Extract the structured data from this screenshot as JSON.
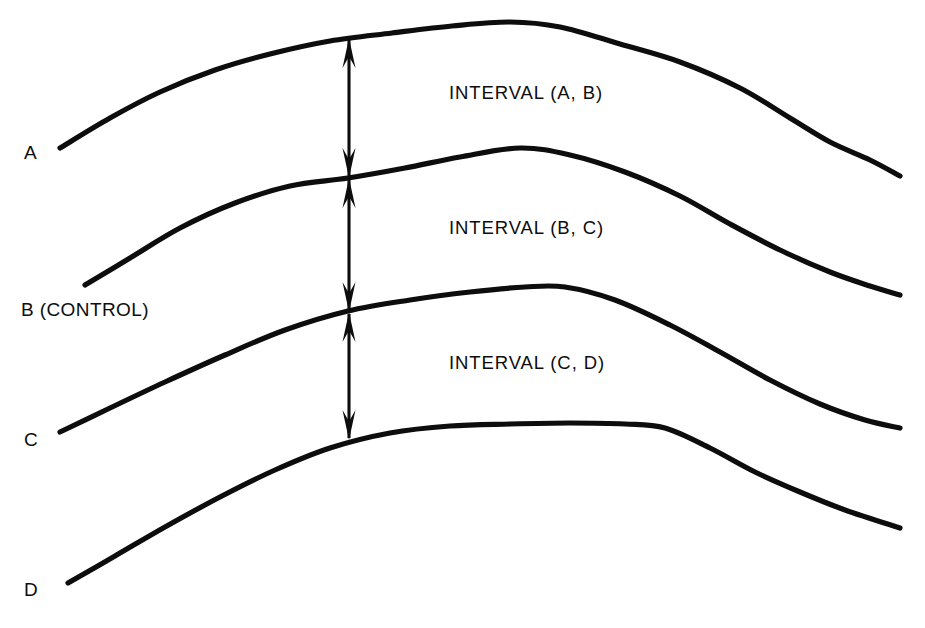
{
  "figure": {
    "type": "line-diagram",
    "background_color": "#ffffff",
    "stroke_color": "#0d0d0d",
    "width": 925,
    "height": 628
  },
  "curve_labels": [
    {
      "id": "A",
      "text": "A",
      "x": 24,
      "y": 143
    },
    {
      "id": "B",
      "text": "B (CONTROL)",
      "x": 21,
      "y": 300
    },
    {
      "id": "C",
      "text": "C",
      "x": 24,
      "y": 430
    },
    {
      "id": "D",
      "text": "D",
      "x": 24,
      "y": 580
    }
  ],
  "interval_labels": [
    {
      "id": "AB",
      "text": "INTERVAL (A, B)",
      "x": 449,
      "y": 84
    },
    {
      "id": "BC",
      "text": "INTERVAL (B, C)",
      "x": 449,
      "y": 219
    },
    {
      "id": "CD",
      "text": "INTERVAL (C, D)",
      "x": 449,
      "y": 354
    }
  ],
  "chart_data": {
    "type": "line",
    "title": "",
    "xlabel": "",
    "ylabel": "",
    "grid": false,
    "legend": "inline-left",
    "axis_visible": false,
    "note": "Four parallel response curves rising to a plateau then declining; vertical double-headed arrows mark the constant vertical separation (interval) between adjacent curves at x=349.",
    "series": [
      {
        "name": "A",
        "label": "A",
        "points": [
          [
            60,
            148
          ],
          [
            110,
            118
          ],
          [
            160,
            92
          ],
          [
            215,
            70
          ],
          [
            270,
            54
          ],
          [
            330,
            41
          ],
          [
            392,
            33
          ],
          [
            452,
            26
          ],
          [
            510,
            22
          ],
          [
            560,
            27
          ],
          [
            620,
            44
          ],
          [
            680,
            62
          ],
          [
            740,
            88
          ],
          [
            790,
            118
          ],
          [
            830,
            142
          ],
          [
            870,
            160
          ],
          [
            900,
            176
          ]
        ]
      },
      {
        "name": "B",
        "label": "B (CONTROL)",
        "points": [
          [
            85,
            285
          ],
          [
            130,
            258
          ],
          [
            180,
            228
          ],
          [
            235,
            203
          ],
          [
            290,
            186
          ],
          [
            348,
            178
          ],
          [
            405,
            168
          ],
          [
            460,
            157
          ],
          [
            520,
            148
          ],
          [
            570,
            155
          ],
          [
            625,
            172
          ],
          [
            680,
            196
          ],
          [
            730,
            224
          ],
          [
            780,
            250
          ],
          [
            830,
            272
          ],
          [
            870,
            286
          ],
          [
            900,
            295
          ]
        ]
      },
      {
        "name": "C",
        "label": "C",
        "points": [
          [
            60,
            432
          ],
          [
            110,
            408
          ],
          [
            165,
            382
          ],
          [
            225,
            355
          ],
          [
            285,
            330
          ],
          [
            348,
            311
          ],
          [
            410,
            300
          ],
          [
            470,
            292
          ],
          [
            525,
            287
          ],
          [
            565,
            287
          ],
          [
            615,
            300
          ],
          [
            670,
            325
          ],
          [
            720,
            352
          ],
          [
            770,
            380
          ],
          [
            820,
            404
          ],
          [
            865,
            420
          ],
          [
            900,
            428
          ]
        ]
      },
      {
        "name": "D",
        "label": "D",
        "points": [
          [
            68,
            583
          ],
          [
            115,
            556
          ],
          [
            165,
            527
          ],
          [
            220,
            497
          ],
          [
            275,
            470
          ],
          [
            330,
            448
          ],
          [
            390,
            433
          ],
          [
            450,
            426
          ],
          [
            510,
            424
          ],
          [
            570,
            423
          ],
          [
            625,
            424
          ],
          [
            665,
            428
          ],
          [
            710,
            448
          ],
          [
            755,
            472
          ],
          [
            800,
            492
          ],
          [
            845,
            510
          ],
          [
            900,
            528
          ]
        ]
      }
    ],
    "annotations": [
      {
        "type": "double-arrow",
        "label": "INTERVAL (A, B)",
        "x": 349,
        "y_from": 38,
        "y_to": 178,
        "length": 140
      },
      {
        "type": "double-arrow",
        "label": "INTERVAL (B, C)",
        "x": 349,
        "y_from": 178,
        "y_to": 312,
        "length": 134
      },
      {
        "type": "double-arrow",
        "label": "INTERVAL (C, D)",
        "x": 349,
        "y_from": 312,
        "y_to": 440,
        "length": 128
      }
    ]
  }
}
